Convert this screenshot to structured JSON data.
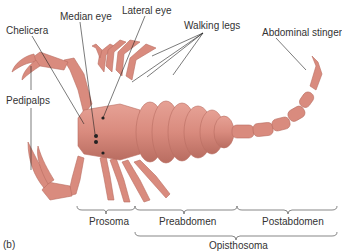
{
  "figure": {
    "panel_label": "(b)",
    "body_color": "#d98b7e",
    "body_shade": "#c4766a",
    "labels": {
      "chelicera": "Chelicera",
      "median_eye": "Median eye",
      "lateral_eye": "Lateral eye",
      "walking_legs": "Walking legs",
      "abdominal_stinger": "Abdominal stinger",
      "pedipalps": "Pedipalps"
    },
    "regions": {
      "prosoma": "Prosoma",
      "preabdomen": "Preabdomen",
      "postabdomen": "Postabdomen",
      "opisthosoma": "Opisthosoma"
    }
  }
}
